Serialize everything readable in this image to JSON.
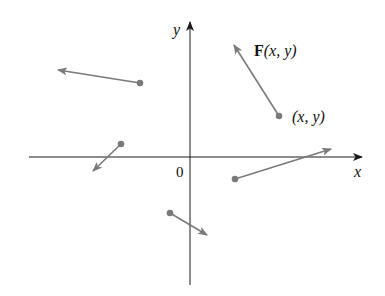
{
  "diagram": {
    "colors": {
      "axis": "#1a1a1a",
      "vector": "#7a7a7a",
      "point": "#7a7a7a",
      "text": "#111111"
    },
    "axes": {
      "x_label": "x",
      "y_label": "y",
      "origin_label": "0",
      "x_axis": {
        "x1": 29,
        "y1": 157,
        "x2": 362,
        "y2": 157
      },
      "y_axis": {
        "x1": 190,
        "y1": 285,
        "x2": 190,
        "y2": 22
      }
    },
    "annotations": {
      "field_label_bold": "F",
      "field_label_rest": "(x, y)",
      "point_label": "(x, y)"
    },
    "vectors": [
      {
        "name": "vector-upper-right",
        "from": [
          279,
          116
        ],
        "to": [
          234,
          45
        ]
      },
      {
        "name": "vector-upper-left",
        "from": [
          140,
          83
        ],
        "to": [
          58,
          70
        ]
      },
      {
        "name": "vector-left-axis",
        "from": [
          121,
          144
        ],
        "to": [
          93,
          171
        ]
      },
      {
        "name": "vector-right-axis",
        "from": [
          235,
          179
        ],
        "to": [
          331,
          149
        ]
      },
      {
        "name": "vector-lower",
        "from": [
          170,
          213
        ],
        "to": [
          207,
          235
        ]
      }
    ]
  }
}
